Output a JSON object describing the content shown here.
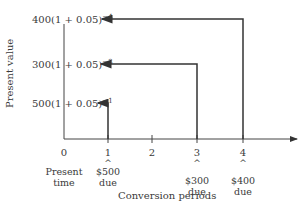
{
  "diagram": {
    "type": "time-diagram",
    "y_axis_label": "Present value",
    "x_axis_label": "Conversion periods",
    "x_ticks": [
      "0",
      "1",
      "2",
      "3",
      "4"
    ],
    "origin_label_line1": "Present",
    "origin_label_line2": "time",
    "payments": [
      {
        "period": "1",
        "amount": "$500",
        "due": "due",
        "pv_base": "500(1 + 0.05)",
        "pv_exp": "−1"
      },
      {
        "period": "3",
        "amount": "$300",
        "due": "due",
        "pv_base": "300(1 + 0.05)",
        "pv_exp": "−3"
      },
      {
        "period": "4",
        "amount": "$400",
        "due": "due",
        "pv_base": "400(1 + 0.05)",
        "pv_exp": "−4"
      }
    ],
    "caret": "^"
  }
}
